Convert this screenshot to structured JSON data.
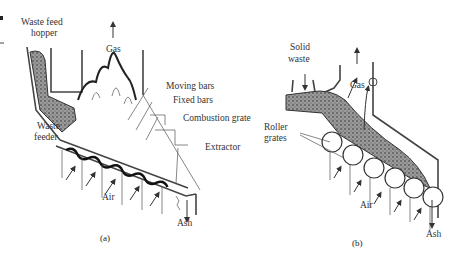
{
  "figure": {
    "panel_a": {
      "caption": "(a)",
      "labels": {
        "hopper_line1": "Waste feed",
        "hopper_line2": "hopper",
        "gas": "Gas",
        "moving_bars": "Moving bars",
        "fixed_bars": "Fixed bars",
        "combustion_grate": "Combustion grate",
        "feeder_line1": "Waste",
        "feeder_line2": "feeder",
        "extractor": "Extractor",
        "air": "Air",
        "ash": "Ash"
      }
    },
    "panel_b": {
      "caption": "(b)",
      "labels": {
        "solid_line1": "Solid",
        "solid_line2": "waste",
        "gas": "Gas",
        "roller_line1": "Roller",
        "roller_line2": "grates",
        "air": "Air",
        "ash": "Ash"
      }
    }
  },
  "colors": {
    "ink": "#333333",
    "background": "#ffffff"
  }
}
